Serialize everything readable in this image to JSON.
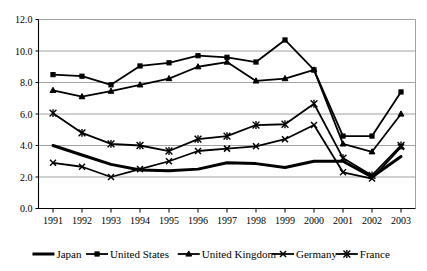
{
  "chart_data": {
    "type": "line",
    "title": "",
    "subtitle": "",
    "xlabel": "",
    "ylabel": "",
    "categories": [
      "1991",
      "1992",
      "1993",
      "1994",
      "1995",
      "1996",
      "1997",
      "1998",
      "1999",
      "2000",
      "2001",
      "2002",
      "2003"
    ],
    "ylim": [
      0.0,
      12.0
    ],
    "ytick_labels": [
      "0.0",
      "2.0",
      "4.0",
      "6.0",
      "8.0",
      "10.0",
      "12.0"
    ],
    "ytick_values": [
      0.0,
      2.0,
      4.0,
      6.0,
      8.0,
      10.0,
      12.0
    ],
    "grid": true,
    "legend_position": "bottom",
    "series": [
      {
        "name": "Japan",
        "marker": "none",
        "values": [
          4.0,
          3.4,
          2.8,
          2.45,
          2.4,
          2.5,
          2.9,
          2.85,
          2.6,
          3.0,
          3.0,
          2.0,
          3.3
        ]
      },
      {
        "name": "United States",
        "marker": "square",
        "values": [
          8.5,
          8.4,
          7.85,
          9.05,
          9.25,
          9.7,
          9.6,
          9.3,
          10.7,
          8.8,
          4.6,
          4.6,
          7.4
        ]
      },
      {
        "name": "United Kingdom",
        "marker": "triangle",
        "values": [
          7.5,
          7.1,
          7.45,
          7.85,
          8.25,
          9.0,
          9.3,
          8.1,
          8.25,
          8.8,
          4.1,
          3.6,
          6.0
        ]
      },
      {
        "name": "Germany",
        "marker": "x",
        "values": [
          2.9,
          2.65,
          2.0,
          2.5,
          3.0,
          3.65,
          3.8,
          3.95,
          4.4,
          5.3,
          2.3,
          1.9,
          3.9
        ]
      },
      {
        "name": "France",
        "marker": "asterisk",
        "values": [
          6.05,
          4.8,
          4.1,
          4.0,
          3.65,
          4.4,
          4.6,
          5.3,
          5.35,
          6.65,
          3.2,
          2.1,
          4.0
        ]
      }
    ]
  },
  "legend": {
    "items": [
      {
        "label": "Japan",
        "marker": "none"
      },
      {
        "label": "United States",
        "marker": "square"
      },
      {
        "label": "United Kingdom",
        "marker": "triangle"
      },
      {
        "label": "Germany",
        "marker": "x"
      },
      {
        "label": "France",
        "marker": "asterisk"
      }
    ]
  },
  "colors": {
    "series": "#000000",
    "grid": "#8a8a8a",
    "axis": "#000000",
    "background": "#ffffff"
  }
}
